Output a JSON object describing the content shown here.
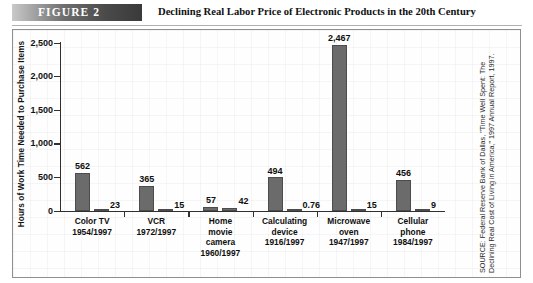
{
  "header": {
    "figure_tag": "FIGURE  2",
    "title": "Declining Real Labor Price of Electronic Products in the 20th Century"
  },
  "source_note": "SOURCE: Federal Reserve Bank of Dallas, \"Time Well Spent: The Declining Real Cost of Living in America,\" 1997 Annual Report, 1997.",
  "colors": {
    "bar_fill": "#6b6b6b",
    "bar_edge": "#4c4c4c",
    "axis": "#303030",
    "tag_dark": "#3a3a3a",
    "panel_border": "#8f8f8f"
  },
  "chart_data": {
    "type": "bar",
    "title": "Declining Real Labor Price of Electronic Products in the 20th Century",
    "xlabel": "",
    "ylabel": "Hours of Work Time Needed to Purchase Items",
    "ylim": [
      0,
      2500
    ],
    "yticks": [
      0,
      500,
      1000,
      1500,
      2000,
      2500
    ],
    "ytick_labels": [
      "0",
      "500",
      "1,000",
      "1,500",
      "2,000",
      "2,500"
    ],
    "grid": false,
    "legend": "none",
    "categories": [
      "Color TV\n1954/1997",
      "VCR\n1972/1997",
      "Home\nmovie\ncamera\n1960/1997",
      "Calculating\ndevice\n1916/1997",
      "Microwave\noven\n1947/1997",
      "Cellular\nphone\n1984/1997"
    ],
    "category_lines": [
      [
        "Color TV",
        "1954/1997"
      ],
      [
        "VCR",
        "1972/1997"
      ],
      [
        "Home",
        "movie",
        "camera",
        "1960/1997"
      ],
      [
        "Calculating",
        "device",
        "1916/1997"
      ],
      [
        "Microwave",
        "oven",
        "1947/1997"
      ],
      [
        "Cellular",
        "phone",
        "1984/1997"
      ]
    ],
    "series": [
      {
        "name": "Introduction year",
        "values": [
          562,
          365,
          57,
          494,
          2467,
          456
        ],
        "value_labels": [
          "562",
          "365",
          "57",
          "494",
          "2,467",
          "456"
        ]
      },
      {
        "name": "1997",
        "values": [
          23,
          15,
          42,
          0.76,
          15,
          9
        ],
        "value_labels": [
          "23",
          "15",
          "42",
          "0.76",
          "15",
          "9"
        ]
      }
    ]
  }
}
